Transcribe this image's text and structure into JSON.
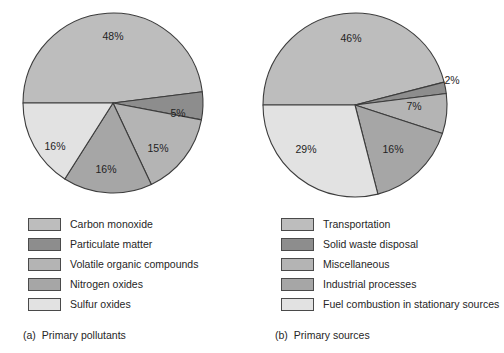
{
  "figure": {
    "background": "#ffffff",
    "stroke": "#3c3c3c"
  },
  "panels": [
    {
      "id": "a",
      "caption_tag": "(a)",
      "caption_text": "Primary pollutants",
      "pie": {
        "center_x": 113,
        "center_y": 103,
        "radius": 90,
        "start_angle_deg": 180
      },
      "legend": [
        {
          "label": "Carbon monoxide",
          "color": "#bdbdbd"
        },
        {
          "label": "Particulate matter",
          "color": "#8d8d8d"
        },
        {
          "label": "Volatile organic compounds",
          "color": "#b4b4b4"
        },
        {
          "label": "Nitrogen oxides",
          "color": "#a6a6a6"
        },
        {
          "label": "Sulfur oxides",
          "color": "#e2e2e2"
        }
      ]
    },
    {
      "id": "b",
      "caption_tag": "(b)",
      "caption_text": "Primary sources",
      "pie": {
        "center_x": 106,
        "center_y": 105,
        "radius": 92,
        "start_angle_deg": 180
      },
      "legend": [
        {
          "label": "Transportation",
          "color": "#bdbdbd"
        },
        {
          "label": "Solid waste disposal",
          "color": "#8d8d8d"
        },
        {
          "label": "Miscellaneous",
          "color": "#b4b4b4"
        },
        {
          "label": "Industrial processes",
          "color": "#a6a6a6"
        },
        {
          "label": "Fuel combustion in stationary sources",
          "color": "#e2e2e2"
        }
      ]
    }
  ],
  "chart_data": [
    {
      "type": "pie",
      "title": "(a) Primary pollutants",
      "categories": [
        "Carbon monoxide",
        "Particulate matter",
        "Volatile organic compounds",
        "Nitrogen oxides",
        "Sulfur oxides"
      ],
      "values": [
        48,
        5,
        15,
        16,
        16
      ],
      "labels": [
        "48%",
        "5%",
        "15%",
        "16%",
        "16%"
      ],
      "colors": [
        "#bdbdbd",
        "#8d8d8d",
        "#b4b4b4",
        "#a6a6a6",
        "#e2e2e2"
      ],
      "unit": "percent",
      "start_angle_deg": 180,
      "direction": "clockwise",
      "legend_position": "below",
      "label_placement": "inside",
      "label_offsets": [
        {
          "text": "48%",
          "x": 113,
          "y": 40
        },
        {
          "text": "5%",
          "x": 178,
          "y": 117
        },
        {
          "text": "15%",
          "x": 158,
          "y": 152
        },
        {
          "text": "16%",
          "x": 106,
          "y": 173
        },
        {
          "text": "16%",
          "x": 55,
          "y": 150
        }
      ]
    },
    {
      "type": "pie",
      "title": "(b) Primary sources",
      "categories": [
        "Transportation",
        "Solid waste disposal",
        "Miscellaneous",
        "Industrial processes",
        "Fuel combustion in stationary sources"
      ],
      "values": [
        46,
        2,
        7,
        16,
        29
      ],
      "labels": [
        "46%",
        "2%",
        "7%",
        "16%",
        "29%"
      ],
      "colors": [
        "#bdbdbd",
        "#8d8d8d",
        "#b4b4b4",
        "#a6a6a6",
        "#e2e2e2"
      ],
      "unit": "percent",
      "start_angle_deg": 180,
      "direction": "clockwise",
      "legend_position": "below",
      "label_placement": "inside except 2% which is outside",
      "label_offsets": [
        {
          "text": "46%",
          "x": 102,
          "y": 42
        },
        {
          "text": "2%",
          "x": 203,
          "y": 84
        },
        {
          "text": "7%",
          "x": 165,
          "y": 110
        },
        {
          "text": "16%",
          "x": 144,
          "y": 153
        },
        {
          "text": "29%",
          "x": 57,
          "y": 153
        }
      ]
    }
  ]
}
